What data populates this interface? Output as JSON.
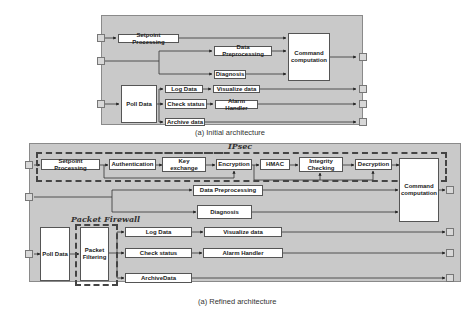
{
  "initial": {
    "caption": "(a) Initial architecture",
    "boxes": {
      "setpoint": "Setpoint Processing",
      "preprocessing": "Data Preprocessing",
      "diagnosis": "Diagnosis",
      "command": "Command computation",
      "poll": "Poll Data",
      "log": "Log Data",
      "visualize": "Visualize data",
      "check": "Check status",
      "alarm": "Alarm Handler",
      "archive": "Archive data"
    }
  },
  "refined": {
    "caption": "(a) Refined architecture",
    "groups": {
      "ipsec": "IPsec",
      "firewall": "Packet Firewall"
    },
    "boxes": {
      "setpoint": "Setpoint Processing",
      "authentication": "Authentication",
      "key_exchange": "Key exchange",
      "encryption": "Encryption",
      "hmac": "HMAC",
      "integrity": "Integrity Checking",
      "decryption": "Decryption",
      "preprocessing": "Data Preprocessing",
      "diagnosis": "Diagnosis",
      "command": "Command computation",
      "poll": "Poll Data",
      "filtering": "Packet Filtering",
      "log": "Log Data",
      "visualize": "Visualize data",
      "check": "Check status",
      "alarm": "Alarm Handler",
      "archive": "ArchiveData"
    }
  }
}
